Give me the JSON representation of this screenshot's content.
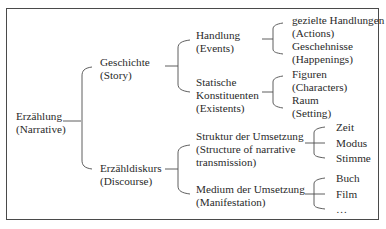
{
  "diagram": {
    "root": {
      "label": "Erzählung",
      "translation": "(Narrative)"
    },
    "level1": [
      {
        "label": "Geschichte",
        "translation": "(Story)"
      },
      {
        "label": "Erzähldiskurs",
        "translation": "(Discourse)"
      }
    ],
    "story_children": [
      {
        "label": "Handlung",
        "translation": "(Events)"
      },
      {
        "label_line1": "Statische",
        "label_line2": "Konstituenten",
        "translation": "(Existents)"
      }
    ],
    "events_children": [
      {
        "label": "gezielte Handlungen",
        "translation": "(Actions)"
      },
      {
        "label": "Geschehnisse",
        "translation": "(Happenings)"
      }
    ],
    "existents_children": [
      {
        "label": "Figuren",
        "translation": "(Characters)"
      },
      {
        "label": "Raum",
        "translation": "(Setting)"
      }
    ],
    "discourse_children": [
      {
        "label": "Struktur der Umsetzung",
        "translation_line1": "(Structure of narrative",
        "translation_line2": "transmission)"
      },
      {
        "label": "Medium der Umsetzung",
        "translation": "(Manifestation)"
      }
    ],
    "structure_children": [
      "Zeit",
      "Modus",
      "Stimme"
    ],
    "manifestation_children": [
      "Buch",
      "Film",
      "…"
    ]
  }
}
